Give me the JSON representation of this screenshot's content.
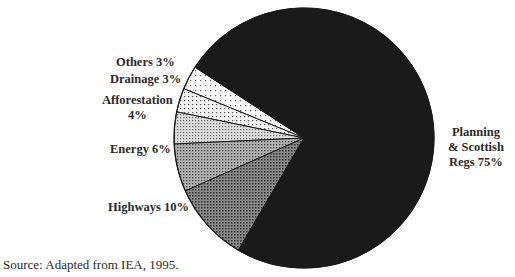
{
  "chart_data": {
    "type": "pie",
    "title": "",
    "categories": [
      "Planning & Scottish Regs",
      "Highways",
      "Energy",
      "Afforestation",
      "Drainage",
      "Others"
    ],
    "values": [
      75,
      10,
      6,
      4,
      3,
      3
    ],
    "unit": "%",
    "labels": [
      {
        "lines": [
          "Planning",
          "& Scottish",
          "Regs 75%"
        ]
      },
      {
        "lines": [
          "Highways 10%"
        ]
      },
      {
        "lines": [
          "Energy 6%"
        ]
      },
      {
        "lines": [
          "Afforestation",
          "4%"
        ]
      },
      {
        "lines": [
          "Drainage 3%"
        ]
      },
      {
        "lines": [
          "Others 3%"
        ]
      }
    ],
    "fills": [
      "#1a1a1a",
      "pattern-dense-dots",
      "pattern-medium-dots",
      "pattern-light-dots",
      "pattern-sparse-dots",
      "pattern-very-sparse-dots"
    ],
    "legend": "none (direct labels)",
    "source": "Source: Adapted from IEA, 1995."
  },
  "labels": {
    "planning_l1": "Planning",
    "planning_l2": "& Scottish",
    "planning_l3": "Regs 75%",
    "highways": "Highways 10%",
    "energy": "Energy 6%",
    "afforestation_l1": "Afforestation",
    "afforestation_l2": "4%",
    "drainage": "Drainage 3%",
    "others": "Others 3%"
  },
  "source": "Source: Adapted from IEA, 1995."
}
